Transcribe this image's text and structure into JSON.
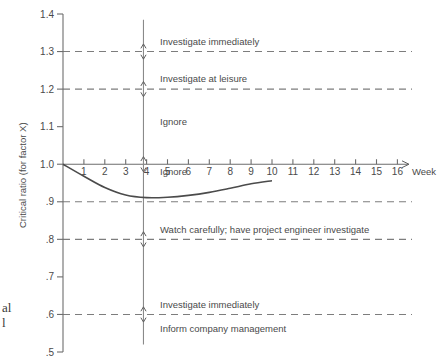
{
  "chart_data": {
    "type": "line",
    "title": "",
    "xlabel": "Week",
    "ylabel": "Critical ratio (for factor X)",
    "xlim": [
      0,
      16
    ],
    "ylim": [
      0.5,
      1.4
    ],
    "grid": false,
    "legend_position": "none",
    "x_ticks": [
      "1",
      "2",
      "3",
      "4",
      "5",
      "6",
      "7",
      "8",
      "9",
      "10",
      "11",
      "12",
      "13",
      "14",
      "15",
      "16"
    ],
    "x_tick_values": [
      1,
      2,
      3,
      4,
      5,
      6,
      7,
      8,
      9,
      10,
      11,
      12,
      13,
      14,
      15,
      16
    ],
    "y_ticks": [
      "1.4",
      "1.3",
      "1.2",
      "1.1",
      "1.0",
      ".9",
      ".8",
      ".7",
      ".6",
      ".5"
    ],
    "y_tick_values": [
      1.4,
      1.3,
      1.2,
      1.1,
      1.0,
      0.9,
      0.8,
      0.7,
      0.6,
      0.5
    ],
    "series": [
      {
        "name": "Critical ratio for factor X",
        "x": [
          0,
          1,
          2,
          3,
          4,
          5,
          6,
          7,
          8,
          9,
          10
        ],
        "values": [
          1.0,
          0.968,
          0.938,
          0.918,
          0.911,
          0.912,
          0.917,
          0.925,
          0.936,
          0.948,
          0.956
        ]
      }
    ],
    "threshold_lines": [
      {
        "value": 1.3,
        "label": "Investigate immediately"
      },
      {
        "value": 1.2,
        "label": "Investigate at leisure"
      },
      {
        "value": 0.9,
        "label": "Watch carefully; have project engineer investigate"
      },
      {
        "value": 0.8,
        "label": "Investigate immediately"
      },
      {
        "value": 0.6,
        "label": "Inform company management"
      }
    ],
    "zone_labels": [
      {
        "text": "Investigate immediately",
        "y": 1.318
      },
      {
        "text": "Investigate at leisure",
        "y": 1.218
      },
      {
        "text": "Ignore",
        "y": 1.105
      },
      {
        "text": "Ignore",
        "y": 0.972
      },
      {
        "text": "Watch carefully; have project engineer investigate",
        "y": 0.818
      },
      {
        "text": "Investigate immediately",
        "y": 0.618
      },
      {
        "text": "Inform company management",
        "y": 0.552
      }
    ],
    "vertical_marker": {
      "x_value": 3.85,
      "label": "current review week",
      "top_value": 1.385,
      "bottom_value": 0.52,
      "arrow_values": [
        1.3,
        1.2,
        1.0,
        0.8,
        0.6
      ]
    },
    "axis_arrow": "week-axis-arrow"
  },
  "caption": {
    "fragment_line1": "al",
    "fragment_line2": "l"
  },
  "colors": {
    "axis": "#6d6d6d",
    "dashed": "#7d7d7d",
    "curve": "#4b4b4b",
    "text": "#4a4a4a",
    "background": "#ffffff"
  }
}
